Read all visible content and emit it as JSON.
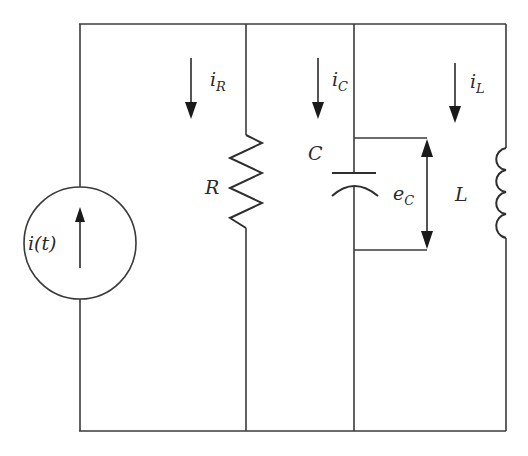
{
  "diagram": {
    "type": "parallel RLC circuit",
    "colors": {
      "stroke": "#3a3a3a",
      "background": "#ffffff"
    },
    "source": {
      "label": "i(t)",
      "kind": "current source",
      "arrow": "up"
    },
    "branches": [
      {
        "component": "resistor",
        "label": "R",
        "current": {
          "base": "i",
          "sub": "R"
        },
        "arrow": "down"
      },
      {
        "component": "capacitor",
        "label": "C",
        "current": {
          "base": "i",
          "sub": "C"
        },
        "arrow": "down",
        "voltage": {
          "base": "e",
          "sub": "C",
          "arrow": "bidirectional"
        }
      },
      {
        "component": "inductor",
        "label": "L",
        "current": {
          "base": "i",
          "sub": "L"
        },
        "arrow": "down"
      }
    ]
  }
}
